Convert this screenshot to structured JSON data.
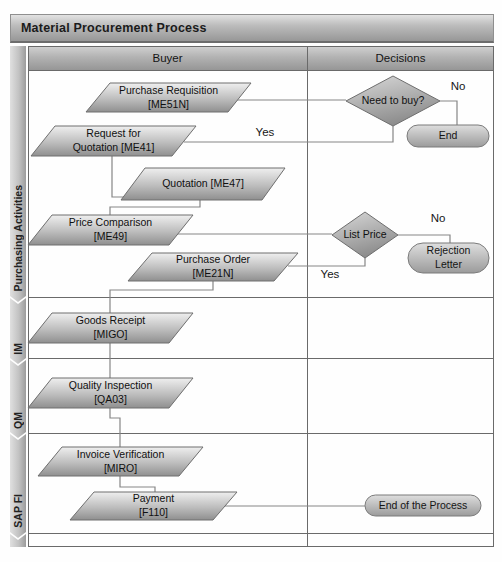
{
  "title": "Material Procurement Process",
  "columns": {
    "buyer": "Buyer",
    "decisions": "Decisions"
  },
  "lanes": [
    {
      "label": "Purchasing Activities"
    },
    {
      "label": "IM"
    },
    {
      "label": "QM"
    },
    {
      "label": "SAP FI"
    }
  ],
  "nodes": {
    "purchase_requisition": "Purchase Requisition\n[ME51N]",
    "request_for_quotation": "Request for\nQuotation [ME41]",
    "quotation": "Quotation [ME47]",
    "price_comparison": "Price Comparison\n[ME49]",
    "purchase_order": "Purchase Order\n[ME21N]",
    "goods_receipt": "Goods Receipt\n[MIGO]",
    "quality_inspection": "Quality Inspection\n[QA03]",
    "invoice_verification": "Invoice Verification\n[MIRO]",
    "payment": "Payment\n[F110]"
  },
  "decisions": {
    "need_to_buy": "Need to buy?",
    "list_price": "List Price"
  },
  "terminals": {
    "end": "End",
    "rejection_letter": "Rejection\nLetter",
    "end_of_process": "End of the Process"
  },
  "edge_labels": {
    "need_to_buy_no": "No",
    "need_to_buy_yes": "Yes",
    "list_price_no": "No",
    "list_price_yes": "Yes"
  },
  "colors": {
    "bar_top": "#e2e2e2",
    "bar_bottom": "#979797",
    "shape_top": "#eeeeee",
    "shape_bottom": "#8f8f8f",
    "line": "#858585",
    "border": "#616161"
  }
}
